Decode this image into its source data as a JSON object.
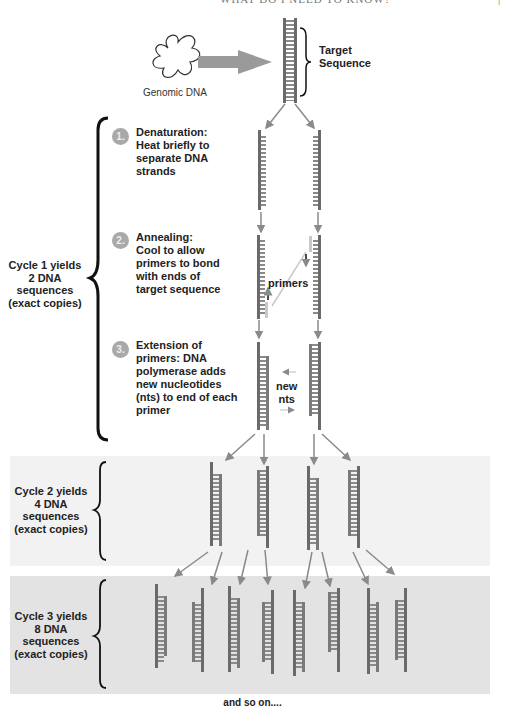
{
  "header": {
    "running_title": "WHAT DO I NEED TO KNOW?",
    "page_marker": "|"
  },
  "top": {
    "genomic_label": "Genomic DNA",
    "target_label_line1": "Target",
    "target_label_line2": "Sequence"
  },
  "steps": [
    {
      "number": "1.",
      "lines": [
        "Denaturation:",
        "Heat briefly to",
        "separate DNA",
        "strands"
      ]
    },
    {
      "number": "2.",
      "lines": [
        "Annealing:",
        "Cool to allow",
        "primers to bond",
        "with ends of",
        "target sequence"
      ]
    },
    {
      "number": "3.",
      "lines": [
        "Extension of",
        "primers: DNA",
        "polymerase adds",
        "new nucleotides",
        "(nts) to end of each",
        "primer"
      ]
    }
  ],
  "annotations": {
    "primers": "primers",
    "new_nts_1": "new",
    "new_nts_2": "nts"
  },
  "cycles": [
    {
      "lines": [
        "Cycle 1 yields",
        "2 DNA",
        "sequences",
        "(exact copies)"
      ]
    },
    {
      "lines": [
        "Cycle 2 yields",
        "4 DNA",
        "sequences",
        "(exact copies)"
      ]
    },
    {
      "lines": [
        "Cycle 3 yields",
        "8 DNA",
        "sequences",
        "(exact copies)"
      ]
    }
  ],
  "footer": {
    "text": "and so on...."
  },
  "colors": {
    "strand": "#7a7a7a",
    "strand_dark": "#4a4a4a",
    "primer": "#c8c8c8",
    "arrow": "#8a8a8a",
    "panel2": "#f2f2f2",
    "panel3": "#e3e3e3"
  }
}
